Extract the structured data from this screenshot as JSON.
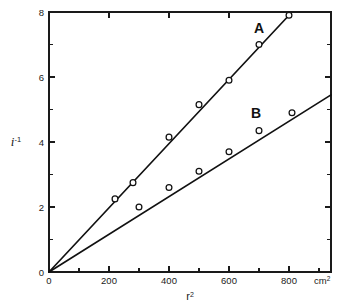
{
  "chart_data": {
    "type": "scatter",
    "title": "",
    "subtitle": "",
    "xlabel": "r",
    "xlabel_sup": "2",
    "xlabel_full": "r²",
    "ylabel": "i",
    "ylabel_sup": "-1",
    "ylabel_full": "i⁻¹",
    "x_unit": "cm",
    "x_unit_sup": "2",
    "x_unit_full": "cm²",
    "xlim": [
      0,
      940
    ],
    "ylim": [
      0,
      8
    ],
    "grid": false,
    "legend": "inline-annotations",
    "frame": "box",
    "x_ticks_major": [
      0,
      200,
      400,
      600,
      800
    ],
    "x_ticks_major_labels": [
      "0",
      "200",
      "400",
      "600",
      "800"
    ],
    "x_ticks_minor": [
      100,
      300,
      500,
      700,
      900
    ],
    "y_ticks_major": [
      0,
      2,
      4,
      6,
      8
    ],
    "y_ticks_major_labels": [
      "0",
      "2",
      "4",
      "6",
      "8"
    ],
    "y_ticks_minor": [
      1,
      3,
      5,
      7
    ],
    "marker_style": "open-circle",
    "series": [
      {
        "name": "A",
        "label": "A",
        "label_x": 700,
        "label_y": 7.35,
        "slope": 0.00985,
        "intercept": 0,
        "line_from": [
          0,
          0
        ],
        "line_to": [
          800,
          7.9
        ],
        "x": [
          220,
          280,
          400,
          500,
          600,
          700,
          800
        ],
        "y": [
          2.25,
          2.75,
          4.15,
          5.15,
          5.9,
          7.0,
          7.9
        ]
      },
      {
        "name": "B",
        "label": "B",
        "label_x": 690,
        "label_y": 4.75,
        "slope": 0.00612,
        "intercept": 0,
        "line_from": [
          0,
          0
        ],
        "line_to": [
          940,
          5.45
        ],
        "x": [
          300,
          400,
          500,
          600,
          700,
          810
        ],
        "y": [
          2.0,
          2.6,
          3.1,
          3.7,
          4.35,
          4.9
        ]
      }
    ]
  },
  "figure": {
    "background_color": "#ffffff",
    "ink_color": "#111111",
    "axis_color": "#1a1a1a"
  }
}
